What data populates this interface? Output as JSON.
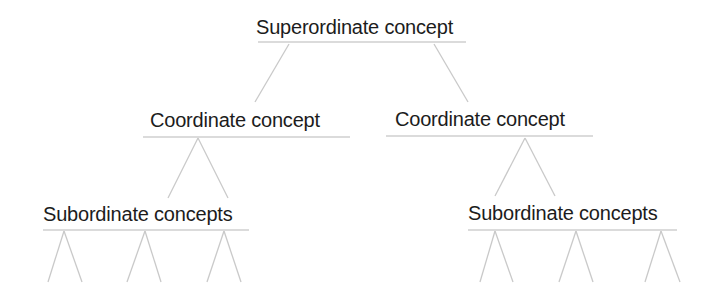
{
  "diagram": {
    "colors": {
      "text": "#1c1c1c",
      "lines": "#c9c9c9",
      "background": "#ffffff"
    },
    "nodes": {
      "superordinate": {
        "label": "Superordinate concept",
        "x": 256,
        "y": 17,
        "underline": [
          258,
          466,
          42
        ]
      },
      "coordinate_left": {
        "label": "Coordinate concept",
        "x": 150,
        "y": 110,
        "underline": [
          143,
          350,
          137
        ]
      },
      "coordinate_right": {
        "label": "Coordinate concept",
        "x": 395,
        "y": 109,
        "underline": [
          386,
          593,
          136
        ]
      },
      "subordinate_left": {
        "label": "Subordinate concepts",
        "x": 43,
        "y": 204,
        "underline": [
          43,
          249,
          230
        ]
      },
      "subordinate_right": {
        "label": "Subordinate concepts",
        "x": 468,
        "y": 203,
        "underline": [
          468,
          677,
          230
        ]
      }
    },
    "edges": [
      {
        "from": "superordinate",
        "to": "coordinate_left",
        "x1": 289,
        "y1": 44,
        "x2": 255,
        "y2": 102
      },
      {
        "from": "superordinate",
        "to": "coordinate_right",
        "x1": 434,
        "y1": 44,
        "x2": 468,
        "y2": 102
      },
      {
        "from": "coordinate_left",
        "to": "subordinate_left",
        "x1": 198,
        "y1": 138,
        "x2": 168,
        "y2": 198
      },
      {
        "from": "coordinate_left",
        "to": "subordinate_left",
        "x1": 198,
        "y1": 138,
        "x2": 228,
        "y2": 198
      },
      {
        "from": "coordinate_right",
        "to": "subordinate_right",
        "x1": 525,
        "y1": 138,
        "x2": 495,
        "y2": 196
      },
      {
        "from": "coordinate_right",
        "to": "subordinate_right",
        "x1": 525,
        "y1": 138,
        "x2": 555,
        "y2": 196
      }
    ],
    "leaf_branches": [
      {
        "parent": "subordinate_left",
        "apex": [
          64,
          231
        ],
        "left": [
          48,
          282
        ],
        "right": [
          82,
          282
        ]
      },
      {
        "parent": "subordinate_left",
        "apex": [
          145,
          231
        ],
        "left": [
          127,
          282
        ],
        "right": [
          161,
          282
        ]
      },
      {
        "parent": "subordinate_left",
        "apex": [
          224,
          231
        ],
        "left": [
          207,
          282
        ],
        "right": [
          241,
          282
        ]
      },
      {
        "parent": "subordinate_right",
        "apex": [
          495,
          231
        ],
        "left": [
          480,
          282
        ],
        "right": [
          513,
          282
        ]
      },
      {
        "parent": "subordinate_right",
        "apex": [
          576,
          231
        ],
        "left": [
          559,
          282
        ],
        "right": [
          593,
          282
        ]
      },
      {
        "parent": "subordinate_right",
        "apex": [
          661,
          231
        ],
        "left": [
          645,
          282
        ],
        "right": [
          680,
          282
        ]
      }
    ]
  }
}
